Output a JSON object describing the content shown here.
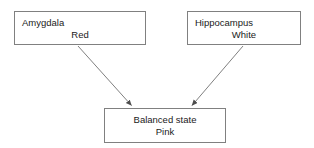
{
  "diagram": {
    "background_color": "#ffffff",
    "border_color": "#808080",
    "text_color": "#1a1a1a",
    "arrow_color": "#666666",
    "nodes": [
      {
        "id": "amygdala",
        "line1": "Amygdala",
        "line2": "Red",
        "line1_align": "left",
        "line2_align": "center"
      },
      {
        "id": "hippocampus",
        "line1": "Hippocampus",
        "line2": "White",
        "line1_align": "left",
        "line2_align": "center"
      },
      {
        "id": "balanced",
        "line1": "Balanced state",
        "line2": "Pink",
        "line1_align": "center",
        "line2_align": "center"
      }
    ],
    "edges": [
      {
        "id": "amygdala-to-balanced",
        "from": "amygdala",
        "to": "balanced",
        "label": ""
      },
      {
        "id": "hippocampus-to-balanced",
        "from": "hippocampus",
        "to": "balanced",
        "label": ""
      }
    ]
  }
}
